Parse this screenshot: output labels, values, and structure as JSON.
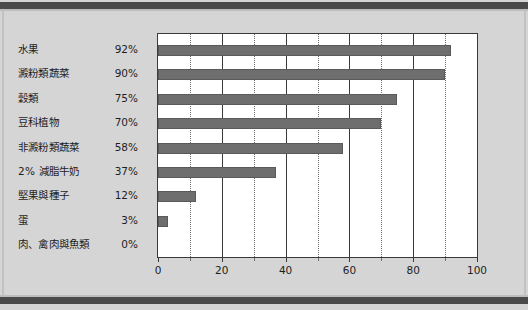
{
  "chart_data": {
    "type": "bar",
    "orientation": "horizontal",
    "title": "",
    "subtitle": "",
    "xlabel": "",
    "ylabel": "",
    "xlim": [
      0,
      100
    ],
    "xticks": [
      0,
      20,
      40,
      60,
      80,
      100
    ],
    "xticklabels": [
      "0",
      "20",
      "40",
      "60",
      "80",
      "100"
    ],
    "minor_gridlines": [
      10,
      30,
      50,
      70,
      90
    ],
    "grid": true,
    "legend": false,
    "bar_color": "#6e6e6e",
    "plot_background": "#ffffff",
    "figure_background": "#d5d5d5",
    "categories": [
      "水果",
      "澱粉類蔬菜",
      "穀類",
      "豆科植物",
      "非澱粉類蔬菜",
      "2% 減脂牛奶",
      "堅果與種子",
      "蛋",
      "肉、禽肉與魚類"
    ],
    "values": [
      92,
      90,
      75,
      70,
      58,
      37,
      12,
      3,
      0
    ],
    "value_labels": [
      "92%",
      "90%",
      "75%",
      "70%",
      "58%",
      "37%",
      "12%",
      "3%",
      "0%"
    ]
  }
}
